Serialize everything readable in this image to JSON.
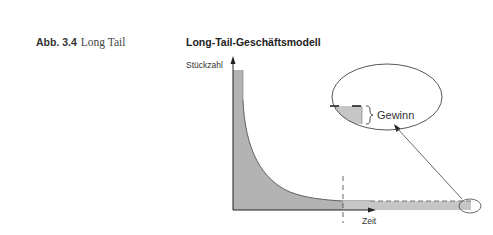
{
  "caption": {
    "number": "Abb. 3.4",
    "text": "Long Tail"
  },
  "figure": {
    "title": "Long-Tail-Geschäftsmodell",
    "y_axis_label": "Stückzahl",
    "x_axis_label": "Zeit",
    "callout_label": "Gewinn",
    "colors": {
      "head_fill": "#b3b3b3",
      "tail_fill": "#c6c6c6",
      "line": "#333333"
    }
  }
}
